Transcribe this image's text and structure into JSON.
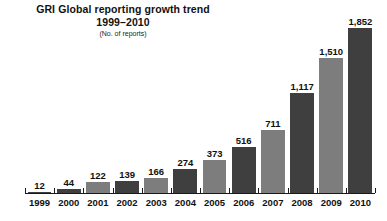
{
  "chart_data": {
    "type": "bar",
    "title": "GRI Global reporting growth trend",
    "subtitle": "1999–2010",
    "note": "(No. of reports)",
    "xlabel": "",
    "ylabel": "",
    "ylim": [
      0,
      1852
    ],
    "grid": false,
    "legend": "none",
    "axis_visible": "x-only",
    "value_labels_shown": true,
    "categories": [
      "1999",
      "2000",
      "2001",
      "2002",
      "2003",
      "2004",
      "2005",
      "2006",
      "2007",
      "2008",
      "2009",
      "2010"
    ],
    "values": [
      12,
      44,
      122,
      139,
      166,
      274,
      373,
      516,
      711,
      1117,
      1510,
      1852
    ],
    "value_labels": [
      "12",
      "44",
      "122",
      "139",
      "166",
      "274",
      "373",
      "516",
      "711",
      "1,117",
      "1,510",
      "1,852"
    ],
    "bar_colors": [
      "#3f3f3f",
      "#3f3f3f",
      "#7d7d7d",
      "#3f3f3f",
      "#7d7d7d",
      "#3f3f3f",
      "#7d7d7d",
      "#3f3f3f",
      "#7d7d7d",
      "#3f3f3f",
      "#7d7d7d",
      "#3f3f3f"
    ],
    "colors": {
      "dark_bar": "#3f3f3f",
      "light_bar": "#7d7d7d",
      "axis": "#1a1a1a",
      "text": "#111111",
      "background": "#ffffff"
    }
  }
}
